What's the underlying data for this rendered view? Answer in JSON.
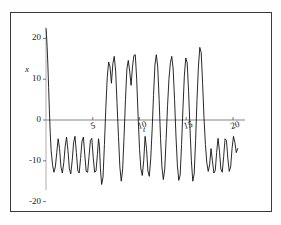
{
  "figure": {
    "background_color": "#ffffff",
    "frame_color": "#3a3a3a",
    "curve_color": "#111111",
    "axis_color": "#555555"
  },
  "labels": {
    "y_axis_label": "x",
    "x_axis_label": "t"
  },
  "chart_data": {
    "type": "line",
    "title": "",
    "subtitle": "",
    "xlabel": "t",
    "ylabel": "x",
    "xlim": [
      -0.2,
      21.5
    ],
    "ylim": [
      -24,
      23
    ],
    "grid": false,
    "legend": null,
    "annotations": [],
    "x_ticks": [
      5,
      10,
      15,
      20
    ],
    "x_tick_labels": [
      "5",
      "10",
      "15",
      "20"
    ],
    "y_ticks": [
      20,
      10,
      0,
      -10,
      -20
    ],
    "y_tick_labels": [
      "20",
      "10",
      "0",
      "-10",
      "-20"
    ],
    "series": [
      {
        "name": "x(t)",
        "color": "#111111",
        "x": [
          0.0,
          0.05,
          0.12,
          0.2,
          0.28,
          0.36,
          0.45,
          0.55,
          0.7,
          0.85,
          1.0,
          1.15,
          1.3,
          1.45,
          1.6,
          1.75,
          1.9,
          2.05,
          2.2,
          2.35,
          2.5,
          2.65,
          2.8,
          2.95,
          3.1,
          3.25,
          3.4,
          3.55,
          3.7,
          3.85,
          4.0,
          4.15,
          4.3,
          4.45,
          4.6,
          4.75,
          4.9,
          5.05,
          5.2,
          5.35,
          5.5,
          5.62,
          5.72,
          5.82,
          5.95,
          6.1,
          6.25,
          6.4,
          6.55,
          6.7,
          6.85,
          7.0,
          7.15,
          7.3,
          7.45,
          7.6,
          7.75,
          7.9,
          8.05,
          8.2,
          8.35,
          8.5,
          8.65,
          8.8,
          8.95,
          9.1,
          9.25,
          9.4,
          9.55,
          9.7,
          9.85,
          10.0,
          10.15,
          10.3,
          10.45,
          10.6,
          10.75,
          10.9,
          11.05,
          11.2,
          11.35,
          11.5,
          11.65,
          11.8,
          11.95,
          12.1,
          12.25,
          12.4,
          12.55,
          12.7,
          12.85,
          13.0,
          13.15,
          13.3,
          13.45,
          13.6,
          13.75,
          13.9,
          14.05,
          14.2,
          14.35,
          14.5,
          14.65,
          14.8,
          14.95,
          15.1,
          15.25,
          15.4,
          15.55,
          15.7,
          15.85,
          16.0,
          16.15,
          16.3,
          16.45,
          16.6,
          16.75,
          16.9,
          17.05,
          17.2,
          17.35,
          17.5,
          17.65,
          17.8,
          17.95,
          18.1,
          18.25,
          18.4,
          18.55,
          18.7,
          18.85,
          19.0,
          19.15,
          19.3,
          19.45,
          19.6,
          19.75,
          19.9,
          20.05,
          20.2,
          20.35,
          20.5
        ],
        "y": [
          22.5,
          21.0,
          18.0,
          13.5,
          8.0,
          2.5,
          -3.0,
          -7.5,
          -11.0,
          -12.8,
          -11.5,
          -8.0,
          -4.6,
          -7.0,
          -11.5,
          -13.0,
          -10.5,
          -6.5,
          -4.2,
          -7.5,
          -12.0,
          -13.2,
          -10.0,
          -5.6,
          -4.0,
          -8.0,
          -12.4,
          -13.0,
          -9.4,
          -5.2,
          -4.2,
          -8.6,
          -12.6,
          -12.8,
          -9.0,
          -5.0,
          -4.5,
          -9.2,
          -12.8,
          -12.5,
          -8.4,
          -4.6,
          -6.5,
          -12.0,
          -15.8,
          -14.0,
          -6.0,
          3.0,
          10.5,
          14.2,
          13.0,
          9.0,
          13.8,
          15.6,
          12.0,
          4.0,
          -4.0,
          -11.5,
          -15.0,
          -12.0,
          -4.0,
          5.0,
          12.5,
          14.6,
          12.0,
          8.5,
          13.0,
          15.8,
          16.0,
          10.0,
          1.0,
          -7.0,
          -12.0,
          -13.6,
          -10.0,
          -4.0,
          -7.0,
          -12.5,
          -13.8,
          -9.5,
          -2.5,
          6.0,
          13.5,
          16.0,
          13.0,
          5.0,
          -4.5,
          -11.5,
          -14.6,
          -12.0,
          -4.5,
          3.5,
          10.0,
          14.0,
          15.6,
          12.5,
          5.0,
          -4.0,
          -11.0,
          -14.8,
          -13.5,
          -6.0,
          3.0,
          11.0,
          15.2,
          14.0,
          7.0,
          -2.0,
          -10.0,
          -15.0,
          -13.2,
          -5.0,
          5.0,
          13.0,
          17.8,
          16.5,
          9.0,
          0.5,
          -6.0,
          -10.5,
          -12.6,
          -11.0,
          -7.0,
          -10.0,
          -13.0,
          -12.4,
          -8.0,
          -4.5,
          -7.5,
          -12.0,
          -12.8,
          -9.0,
          -4.6,
          -5.0,
          -9.5,
          -12.6,
          -11.5,
          -7.0,
          -4.0,
          -5.5,
          -8.0,
          -7.0
        ]
      }
    ]
  }
}
